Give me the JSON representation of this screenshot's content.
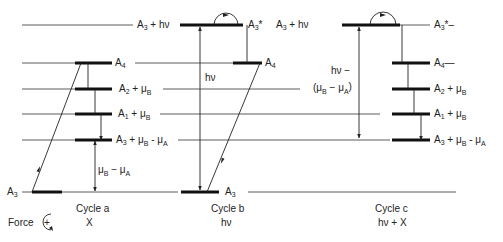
{
  "diagram": {
    "levels": {
      "excited": "A3* / A3 + hν",
      "a4": "A4",
      "a2": "A2 + μB",
      "a1": "A1 + μB",
      "a3mu": "A3 + μB − μA",
      "ground": "A3"
    },
    "labels": {
      "top_left": {
        "base": "A",
        "sub": "3",
        "rest": " + hν"
      },
      "b_star": {
        "base": "A",
        "sub": "3",
        "rest": "*"
      },
      "c_top": {
        "base": "A",
        "sub": "3",
        "rest": " + hν"
      },
      "c_star": {
        "base": "A",
        "sub": "3",
        "rest": "*–"
      },
      "a_a4": {
        "base": "A",
        "sub": "4"
      },
      "b_a4": {
        "base": "A",
        "sub": "4"
      },
      "c_a4": {
        "base": "A",
        "sub": "4",
        "rest": "—"
      },
      "a_a2": {
        "base": "A",
        "sub": "2",
        "rest": " + μ",
        "sub2": "B"
      },
      "c_a2": {
        "base": "A",
        "sub": "2",
        "rest": " + μ",
        "sub2": "B"
      },
      "a_a1": {
        "base": "A",
        "sub": "1",
        "rest": " + μ",
        "sub2": "B"
      },
      "c_a1": {
        "base": "A",
        "sub": "1",
        "rest": " + μ",
        "sub2": "B"
      },
      "a_a3mu": {
        "base": "A",
        "sub": "3",
        "rest": " + μ",
        "sub2": "B",
        "rest2": " - μ",
        "sub3": "A"
      },
      "c_a3mu": {
        "base": "A",
        "sub": "3",
        "rest": " + μ",
        "sub2": "B",
        "rest2": " - μ",
        "sub3": "A"
      },
      "a_ground": {
        "base": "A",
        "sub": "3"
      },
      "b_ground": {
        "base": "A",
        "sub": "3"
      },
      "a_gap": {
        "t1": "μ",
        "s1": "B",
        "t2": " − μ",
        "s2": "A"
      },
      "b_gap": "hν",
      "c_gap_line1": "hν −",
      "c_gap_line2": {
        "t1": "(μ",
        "s1": "B",
        "t2": " − μ",
        "s2": "A",
        "t3": ")"
      }
    },
    "cycles": [
      {
        "name": "Cycle a",
        "input": "X"
      },
      {
        "name": "Cycle b",
        "input": "hν"
      },
      {
        "name": "Cycle c",
        "input": "hν + X"
      }
    ],
    "force_label": "Force",
    "force_symbol": "+"
  }
}
